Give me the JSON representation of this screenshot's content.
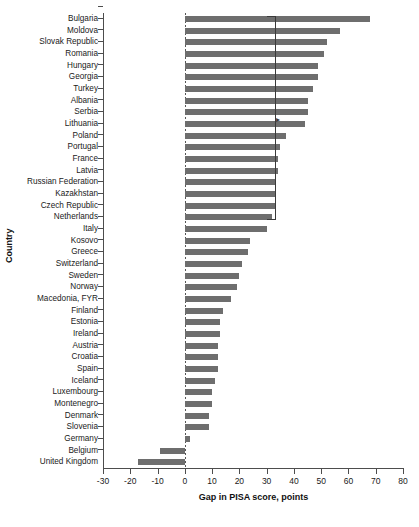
{
  "chart_data": {
    "type": "bar",
    "orientation": "horizontal",
    "title": "",
    "xlabel": "Gap in PISA score, points",
    "ylabel": "Country",
    "xlim": [
      -30,
      80
    ],
    "xticks": [
      -30,
      -20,
      -10,
      0,
      10,
      20,
      30,
      40,
      50,
      60,
      70,
      80
    ],
    "xticklabels": [
      "-30",
      "-20",
      "-10",
      "0",
      "10",
      "20",
      "30",
      "40",
      "50",
      "60",
      "70",
      "80"
    ],
    "grid": false,
    "legend": null,
    "zero_reference_line": 0,
    "annotations": [
      {
        "kind": "bracket",
        "value": 33,
        "from_category": "Bulgaria",
        "to_category": "Netherlands",
        "label": ""
      },
      {
        "kind": "marker-arrow",
        "value": 33,
        "category": "Lithuania",
        "label": ""
      }
    ],
    "categories": [
      "Bulgaria",
      "Moldova",
      "Slovak Republic",
      "Romania",
      "Hungary",
      "Georgia",
      "Turkey",
      "Albania",
      "Serbia",
      "Lithuania",
      "Poland",
      "Portugal",
      "France",
      "Latvia",
      "Russian Federation",
      "Kazakhstan",
      "Czech Republic",
      "Netherlands",
      "Italy",
      "Kosovo",
      "Greece",
      "Switzerland",
      "Sweden",
      "Norway",
      "Macedonia, FYR",
      "Finland",
      "Estonia",
      "Ireland",
      "Austria",
      "Croatia",
      "Spain",
      "Iceland",
      "Luxembourg",
      "Montenegro",
      "Denmark",
      "Slovenia",
      "Germany",
      "Belgium",
      "United Kingdom"
    ],
    "values": [
      68,
      57,
      52,
      51,
      49,
      49,
      47,
      45,
      45,
      44,
      37,
      35,
      34,
      34,
      33,
      33,
      33,
      32,
      30,
      24,
      23,
      21,
      20,
      19,
      17,
      14,
      13,
      13,
      12,
      12,
      12,
      11,
      10,
      10,
      9,
      9,
      2,
      -9,
      -17
    ],
    "bar_color": "#6e6e6e"
  }
}
